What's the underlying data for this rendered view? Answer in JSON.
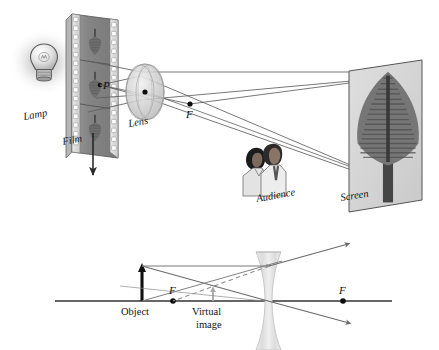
{
  "figure": {
    "background_color": "#ffffff",
    "ink_color": "#222222",
    "ray_color": "#555555",
    "panels": [
      {
        "id": "projector",
        "name": "film-projector-scene",
        "description": "Slide projector: lamp illuminates film, converging lens projects inverted enlarged image of a tree onto a screen watched by an audience."
      },
      {
        "id": "ray-diagram",
        "name": "diverging-lens-ray-diagram",
        "description": "Principal-axis ray diagram of a biconcave diverging lens forming an upright reduced virtual image."
      }
    ]
  },
  "projector": {
    "labels": {
      "lamp": "Lamp",
      "film": "Film",
      "lens": "Lens",
      "focal_point": "F",
      "object_point": "P",
      "audience": "Audience",
      "screen": "Screen"
    },
    "colors": {
      "film_body": "#8a8a8a",
      "film_edge": "#d8d8d8",
      "screen_face": "#d5d5d5",
      "lens_glass": "#cfcfcf",
      "lamp_glow": "#bdbdbd",
      "tree_foliage": "#6f6f6f",
      "tree_trunk": "#4a4a4a"
    },
    "film_frames": 3,
    "sprocket_count": 15,
    "arrow_label": "film travel direction"
  },
  "ray_diagram": {
    "labels": {
      "object": "Object",
      "focal_near": "F",
      "focal_far": "F",
      "virtual_image": "Virtual image",
      "virtual_image_line1": "Virtual",
      "virtual_image_line2": "image"
    },
    "colors": {
      "axis": "#333333",
      "object_arrow": "#111111",
      "lens_glass": "#d9d9d9",
      "solid_ray": "#6a6a6a",
      "dashed_ray": "#8d8d8d",
      "image_arrow": "#a8a8a8"
    },
    "geometry": {
      "axis_y": 301,
      "axis_x_start": 55,
      "axis_x_end": 392,
      "object_x": 142,
      "object_top_y": 266,
      "focal_near_x": 173,
      "focal_far_x": 343,
      "lens_center_x": 268,
      "image_x": 213,
      "image_top_y": 288
    },
    "lens_type": "biconcave diverging"
  }
}
